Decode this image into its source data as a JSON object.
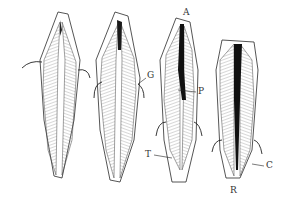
{
  "figure": {
    "labels": {
      "A": "A",
      "G": "G",
      "P": "P",
      "T": "T",
      "C": "C",
      "R": "R"
    },
    "colors": {
      "ink": "#2a2a2a",
      "hatch": "#6a6a6a",
      "pulp": "#111111",
      "background": "#ffffff"
    }
  }
}
